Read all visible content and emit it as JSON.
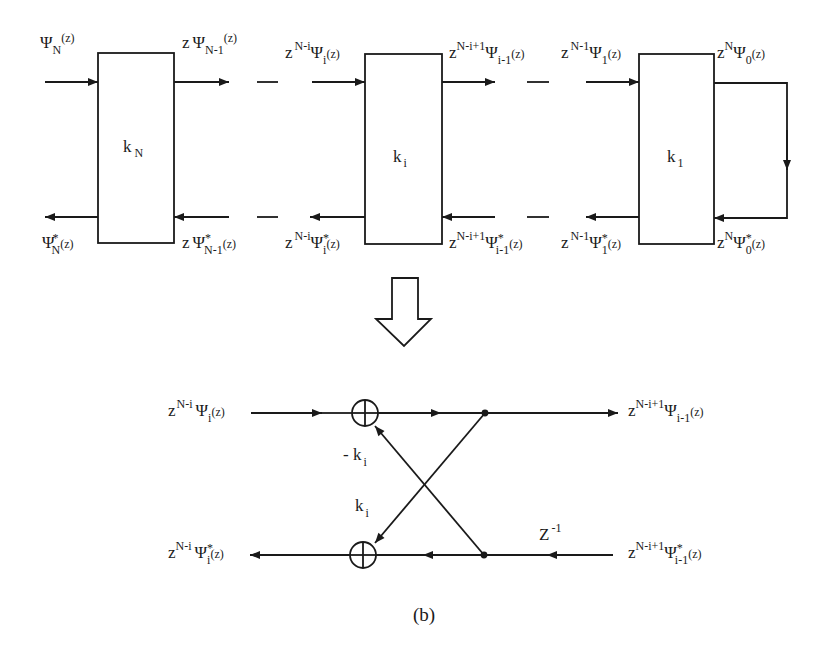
{
  "figure": {
    "caption": "(b)",
    "colors": {
      "ink": "#1a1a1a",
      "background": "#ffffff"
    }
  },
  "lattice": {
    "stages": [
      {
        "block": {
          "k": "k",
          "sub": "N"
        },
        "in_top": {
          "pre": "",
          "sup": "",
          "psi": "Ψ",
          "sub": "N",
          "star": "",
          "arg": "(z)"
        },
        "out_top": {
          "pre": "z",
          "sup": "",
          "psi": "Ψ",
          "sub": "N-1",
          "star": "",
          "arg": "(z)"
        },
        "out_bottom": {
          "pre": "",
          "sup": "",
          "psi": "Ψ",
          "sub": "N",
          "star": "*",
          "arg": "(z)"
        },
        "in_bottom": {
          "pre": "z",
          "sup": "",
          "psi": "Ψ",
          "sub": "N-1",
          "star": "*",
          "arg": "(z)"
        }
      },
      {
        "block": {
          "k": "k",
          "sub": "i"
        },
        "in_top": {
          "pre": "z",
          "sup": "N-i",
          "psi": "Ψ",
          "sub": "i",
          "star": "",
          "arg": "(z)"
        },
        "out_top": {
          "pre": "z",
          "sup": "N-i+1",
          "psi": "Ψ",
          "sub": "i-1",
          "star": "",
          "arg": "(z)"
        },
        "out_bottom": {
          "pre": "z",
          "sup": "N-i",
          "psi": "Ψ",
          "sub": "i",
          "star": "*",
          "arg": "(z)"
        },
        "in_bottom": {
          "pre": "z",
          "sup": "N-i+1",
          "psi": "Ψ",
          "sub": "i-1",
          "star": "*",
          "arg": "(z)"
        }
      },
      {
        "block": {
          "k": "k",
          "sub": "1"
        },
        "in_top": {
          "pre": "z",
          "sup": "N-1",
          "psi": "Ψ",
          "sub": "1",
          "star": "",
          "arg": "(z)"
        },
        "out_top": {
          "pre": "z",
          "sup": "N",
          "psi": "Ψ",
          "sub": "0",
          "star": "",
          "arg": "(z)"
        },
        "out_bottom": {
          "pre": "z",
          "sup": "N-1",
          "psi": "Ψ",
          "sub": "1",
          "star": "*",
          "arg": "(z)"
        },
        "in_bottom": {
          "pre": "z",
          "sup": "N",
          "psi": "Ψ",
          "sub": "0",
          "star": "*",
          "arg": "(z)"
        }
      }
    ]
  },
  "expansion_arrow": {
    "meaning": "expands-to",
    "direction": "down"
  },
  "detail": {
    "in_top": {
      "pre": "z",
      "sup": "N-i",
      "psi": "Ψ",
      "sub": "i",
      "star": "",
      "arg": "(z)"
    },
    "out_top": {
      "pre": "z",
      "sup": "N-i+1",
      "psi": "Ψ",
      "sub": "i-1",
      "star": "",
      "arg": "(z)"
    },
    "out_bottom": {
      "pre": "z",
      "sup": "N-i",
      "psi": "Ψ",
      "sub": "i",
      "star": "*",
      "arg": "(z)"
    },
    "in_bottom": {
      "pre": "z",
      "sup": "N-i+1",
      "psi": "Ψ",
      "sub": "i-1",
      "star": "*",
      "arg": "(z)"
    },
    "gain_up": {
      "k": "- k",
      "sub": "i"
    },
    "gain_down": {
      "k": "k",
      "sub": "i"
    },
    "delay": {
      "base": "Z",
      "sup": "-1"
    },
    "adder_symbol": "⊕"
  }
}
